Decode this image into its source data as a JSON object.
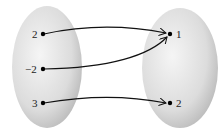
{
  "diagram": {
    "type": "mapping",
    "domain_set": {
      "elements": [
        "2",
        "−2",
        "3"
      ]
    },
    "range_set": {
      "elements": [
        "1",
        "2"
      ]
    },
    "mappings": [
      {
        "from": "2",
        "to": "1"
      },
      {
        "from": "−2",
        "to": "1"
      },
      {
        "from": "3",
        "to": "2"
      }
    ],
    "colors": {
      "oval_light": "#f2f2f2",
      "oval_dark": "#bdbdbd",
      "arrow": "#111111",
      "dot": "#000000"
    }
  }
}
